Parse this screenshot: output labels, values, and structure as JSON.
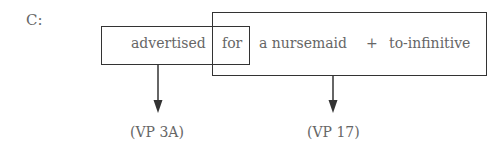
{
  "diagram": {
    "label": "C:",
    "words": {
      "advertised": "advertised",
      "for": "for",
      "object": "a nursemaid",
      "plus": "+",
      "infinitive": "to-infinitive"
    },
    "annotations": {
      "left": "(VP 3A)",
      "right": "(VP 17)"
    }
  }
}
